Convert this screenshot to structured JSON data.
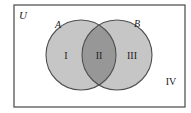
{
  "diagram": {
    "type": "venn",
    "universe_label": "U",
    "sets": [
      {
        "name": "A",
        "label": "A"
      },
      {
        "name": "B",
        "label": "B"
      }
    ],
    "regions": [
      {
        "id": "I",
        "label": "I",
        "description": "A only"
      },
      {
        "id": "II",
        "label": "II",
        "description": "A and B"
      },
      {
        "id": "III",
        "label": "III",
        "description": "B only"
      },
      {
        "id": "IV",
        "label": "IV",
        "description": "neither A nor B"
      }
    ],
    "colors": {
      "circle_fill": "#c6c6c6",
      "overlap_fill": "#979797",
      "stroke": "#505050",
      "frame": "#555555",
      "background": "#ffffff"
    }
  }
}
